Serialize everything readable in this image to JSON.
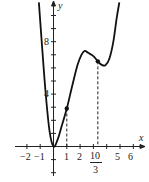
{
  "chart_data": {
    "type": "line",
    "title": "",
    "xlabel": "x",
    "ylabel": "y",
    "xlim": [
      -2.5,
      6.8
    ],
    "ylim": [
      -1.8,
      11
    ],
    "grid": false,
    "x_tick_labels": [
      "-2",
      "-1",
      "1",
      "2",
      "10/3",
      "5",
      "6"
    ],
    "x_tick_values": [
      -2,
      -1,
      1,
      2,
      3.333,
      5,
      6
    ],
    "y_tick_labels": [
      "4",
      "8"
    ],
    "y_tick_values": [
      4,
      8
    ],
    "series": [
      {
        "name": "f(x)",
        "x": [
          -1.1,
          -0.9,
          -0.6,
          -0.3,
          0,
          0.3,
          0.6,
          1,
          1.4,
          1.8,
          2.1,
          2.35,
          2.6,
          3.0,
          3.333,
          3.6,
          3.9,
          4.2,
          4.5,
          4.75,
          4.95
        ],
        "y": [
          11,
          8.2,
          4.2,
          1.2,
          0,
          0.5,
          1.5,
          2.9,
          4.6,
          6.2,
          7.0,
          7.3,
          7.15,
          6.9,
          6.5,
          6.25,
          6.2,
          6.7,
          8.0,
          9.8,
          11
        ]
      }
    ],
    "marked_points": [
      {
        "x": 1,
        "y": 2.9
      },
      {
        "x": 3.333,
        "y": 6.5
      }
    ],
    "dashed_verticals": [
      1,
      3.333
    ]
  },
  "labels": {
    "x_axis": "x",
    "y_axis": "y",
    "ticks_x": [
      "−2",
      "−1",
      "1",
      "2",
      "5",
      "6"
    ],
    "frac_num": "10",
    "frac_den": "3",
    "y4": "4",
    "y8": "8"
  }
}
